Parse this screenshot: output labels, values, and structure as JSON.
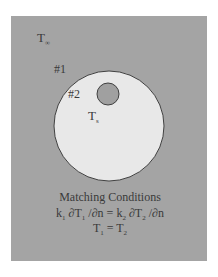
{
  "diagram": {
    "ambient_label": "T",
    "ambient_sub": "∞",
    "region1_label": "#1",
    "region2_label": "#2",
    "source_label": "T",
    "source_sub": "s",
    "conditions_title": "Matching Conditions",
    "eq1": {
      "k1": "k",
      "k1_sub": "1",
      "d1": " ∂T",
      "d1_sub": "1",
      "mid": " /∂n = k",
      "k2_sub": "2",
      "d2": " ∂T",
      "d2_sub": "2",
      "end": " /∂n"
    },
    "eq2": {
      "a": "T",
      "a_sub": "1",
      "mid": " = T",
      "b_sub": "2"
    },
    "colors": {
      "background": "#a4a4a4",
      "region2_fill": "#e8e8e8",
      "inclusion_fill": "#a0a0a0",
      "outline": "#404040"
    }
  }
}
